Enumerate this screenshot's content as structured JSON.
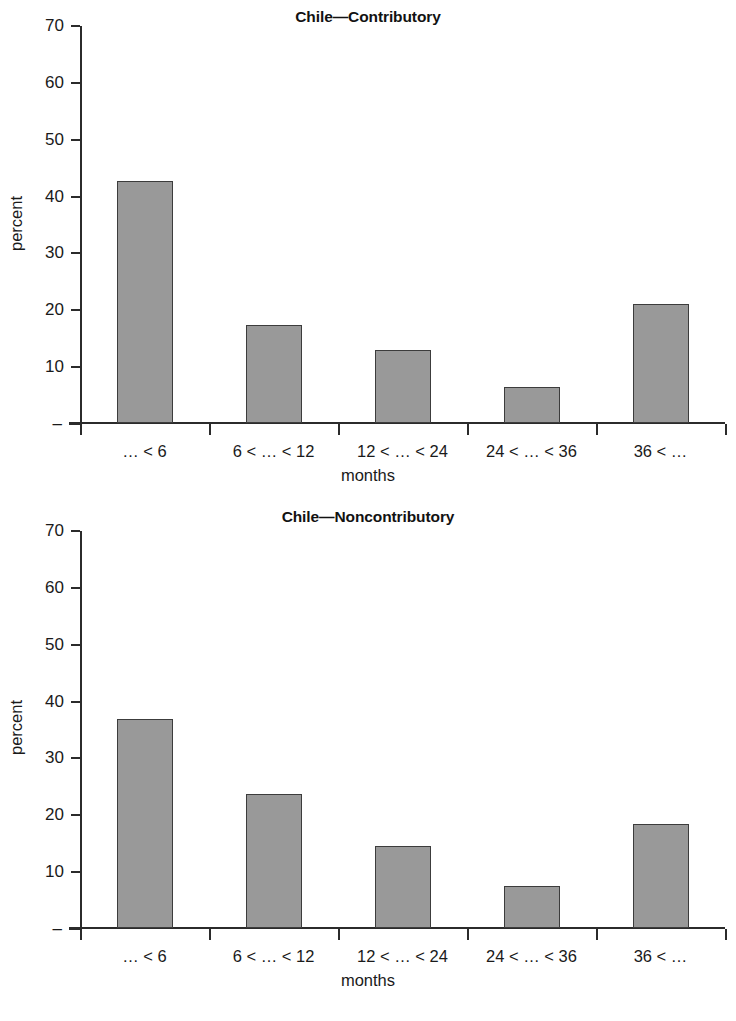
{
  "chart_data": [
    {
      "type": "bar",
      "title": "Chile—Contributory",
      "xlabel": "months",
      "ylabel": "percent",
      "categories": [
        "… < 6",
        "6 < … < 12",
        "12 < … < 24",
        "24 < … < 36",
        "36 < …"
      ],
      "values": [
        42.5,
        17.3,
        12.9,
        6.3,
        21.0
      ],
      "ylim": [
        0,
        70
      ],
      "yticks": [
        0,
        10,
        20,
        30,
        40,
        50,
        60,
        70
      ],
      "ytick_labels": [
        "–",
        "10",
        "20",
        "30",
        "40",
        "50",
        "60",
        "70"
      ],
      "grid": false,
      "legend": "none",
      "bar_color": "#999999",
      "bar_edge_color": "#3c3c3c"
    },
    {
      "type": "bar",
      "title": "Chile—Noncontributory",
      "xlabel": "months",
      "ylabel": "percent",
      "categories": [
        "… < 6",
        "6 < … < 12",
        "12 < … < 24",
        "24 < … < 36",
        "36 < …"
      ],
      "values": [
        36.8,
        23.5,
        14.4,
        7.4,
        18.3
      ],
      "ylim": [
        0,
        70
      ],
      "yticks": [
        0,
        10,
        20,
        30,
        40,
        50,
        60,
        70
      ],
      "ytick_labels": [
        "–",
        "10",
        "20",
        "30",
        "40",
        "50",
        "60",
        "70"
      ],
      "grid": false,
      "legend": "none",
      "bar_color": "#999999",
      "bar_edge_color": "#3c3c3c"
    }
  ]
}
